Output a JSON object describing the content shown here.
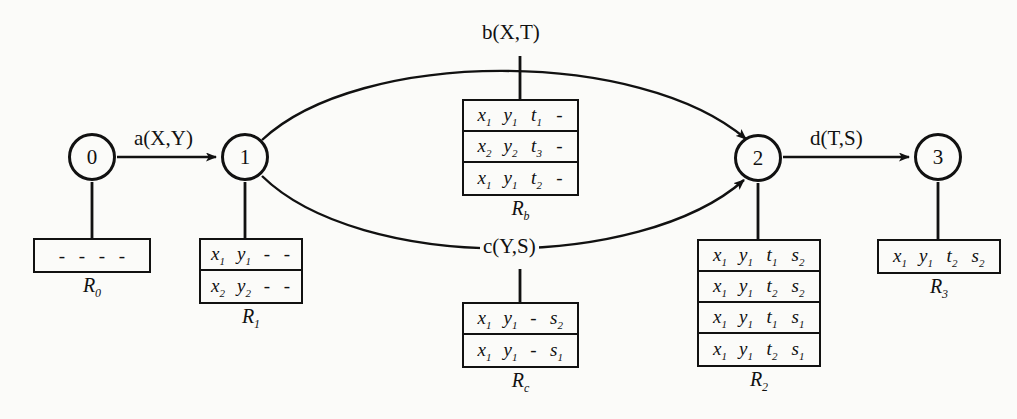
{
  "diagram": {
    "stroke_color": "#111111",
    "background_color": "#fbfbf9"
  },
  "nodes": [
    {
      "id": "node-0",
      "label": "0",
      "cx": 92,
      "cy": 157,
      "r": 24
    },
    {
      "id": "node-1",
      "label": "1",
      "cx": 245,
      "cy": 157,
      "r": 24
    },
    {
      "id": "node-2",
      "label": "2",
      "cx": 758,
      "cy": 158,
      "r": 24
    },
    {
      "id": "node-3",
      "label": "3",
      "cx": 938,
      "cy": 157,
      "r": 24
    }
  ],
  "edges": [
    {
      "id": "edge-a",
      "label": "a(X,Y)",
      "from": "0",
      "to": "1",
      "shape": "straight"
    },
    {
      "id": "edge-b",
      "label": "b(X,T)",
      "from": "1",
      "to": "2",
      "shape": "arc-up"
    },
    {
      "id": "edge-c",
      "label": "c(Y,S)",
      "from": "1",
      "to": "2",
      "shape": "arc-down"
    },
    {
      "id": "edge-d",
      "label": "d(T,S)",
      "from": "2",
      "to": "3",
      "shape": "straight"
    }
  ],
  "tables": [
    {
      "id": "table-R0",
      "caption": "R",
      "caption_sub": "0",
      "rows": [
        [
          {
            "t": "-",
            "s": ""
          },
          {
            "t": "-",
            "s": ""
          },
          {
            "t": "-",
            "s": ""
          },
          {
            "t": "-",
            "s": ""
          }
        ]
      ]
    },
    {
      "id": "table-R1",
      "caption": "R",
      "caption_sub": "1",
      "rows": [
        [
          {
            "t": "x",
            "s": "1"
          },
          {
            "t": "y",
            "s": "1"
          },
          {
            "t": "-",
            "s": ""
          },
          {
            "t": "-",
            "s": ""
          }
        ],
        [
          {
            "t": "x",
            "s": "2"
          },
          {
            "t": "y",
            "s": "2"
          },
          {
            "t": "-",
            "s": ""
          },
          {
            "t": "-",
            "s": ""
          }
        ]
      ]
    },
    {
      "id": "table-Rb",
      "caption": "R",
      "caption_sub": "b",
      "rows": [
        [
          {
            "t": "x",
            "s": "1"
          },
          {
            "t": "y",
            "s": "1"
          },
          {
            "t": "t",
            "s": "1"
          },
          {
            "t": "-",
            "s": ""
          }
        ],
        [
          {
            "t": "x",
            "s": "2"
          },
          {
            "t": "y",
            "s": "2"
          },
          {
            "t": "t",
            "s": "3"
          },
          {
            "t": "-",
            "s": ""
          }
        ],
        [
          {
            "t": "x",
            "s": "1"
          },
          {
            "t": "y",
            "s": "1"
          },
          {
            "t": "t",
            "s": "2"
          },
          {
            "t": "-",
            "s": ""
          }
        ]
      ]
    },
    {
      "id": "table-Rc",
      "caption": "R",
      "caption_sub": "c",
      "rows": [
        [
          {
            "t": "x",
            "s": "1"
          },
          {
            "t": "y",
            "s": "1"
          },
          {
            "t": "-",
            "s": ""
          },
          {
            "t": "s",
            "s": "2"
          }
        ],
        [
          {
            "t": "x",
            "s": "1"
          },
          {
            "t": "y",
            "s": "1"
          },
          {
            "t": "-",
            "s": ""
          },
          {
            "t": "s",
            "s": "1"
          }
        ]
      ]
    },
    {
      "id": "table-R2",
      "caption": "R",
      "caption_sub": "2",
      "rows": [
        [
          {
            "t": "x",
            "s": "1"
          },
          {
            "t": "y",
            "s": "1"
          },
          {
            "t": "t",
            "s": "1"
          },
          {
            "t": "s",
            "s": "2"
          }
        ],
        [
          {
            "t": "x",
            "s": "1"
          },
          {
            "t": "y",
            "s": "1"
          },
          {
            "t": "t",
            "s": "2"
          },
          {
            "t": "s",
            "s": "2"
          }
        ],
        [
          {
            "t": "x",
            "s": "1"
          },
          {
            "t": "y",
            "s": "1"
          },
          {
            "t": "t",
            "s": "1"
          },
          {
            "t": "s",
            "s": "1"
          }
        ],
        [
          {
            "t": "x",
            "s": "1"
          },
          {
            "t": "y",
            "s": "1"
          },
          {
            "t": "t",
            "s": "2"
          },
          {
            "t": "s",
            "s": "1"
          }
        ]
      ]
    },
    {
      "id": "table-R3",
      "caption": "R",
      "caption_sub": "3",
      "rows": [
        [
          {
            "t": "x",
            "s": "1"
          },
          {
            "t": "y",
            "s": "1"
          },
          {
            "t": "t",
            "s": "2"
          },
          {
            "t": "s",
            "s": "2"
          }
        ]
      ]
    }
  ]
}
